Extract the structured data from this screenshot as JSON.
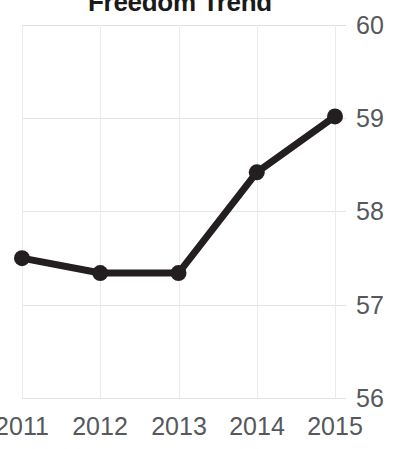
{
  "chart_data": {
    "type": "line",
    "title": "Freedom Trend",
    "xlabel": "",
    "ylabel": "",
    "categories": [
      "2011",
      "2012",
      "2013",
      "2014",
      "2015"
    ],
    "x": [
      2011,
      2012,
      2013,
      2014,
      2015
    ],
    "values": [
      57.5,
      57.34,
      57.34,
      58.42,
      59.02
    ],
    "series": [
      {
        "name": "Freedom Score",
        "values": [
          57.5,
          57.34,
          57.34,
          58.42,
          59.02
        ]
      }
    ],
    "ylim": [
      56,
      60
    ],
    "yticks": [
      60,
      59,
      58,
      57,
      56
    ],
    "ytick_labels": [
      "60",
      "59",
      "58",
      "57",
      "56"
    ],
    "xticks": [
      2011,
      2012,
      2013,
      2014,
      2015
    ],
    "xtick_labels": [
      "2011",
      "2012",
      "2013",
      "2014",
      "2015"
    ],
    "grid": true,
    "legend": "none",
    "series_color": "#231f20",
    "grid_color": "#e4e4e4",
    "marker": "circle",
    "y_axis_side": "right"
  },
  "colors": {
    "background": "#ffffff",
    "line": "#231f20",
    "marker": "#231f20",
    "grid": "#e4e4e4",
    "tick_text": "#55585c",
    "title_text": "#1a1a1a"
  }
}
